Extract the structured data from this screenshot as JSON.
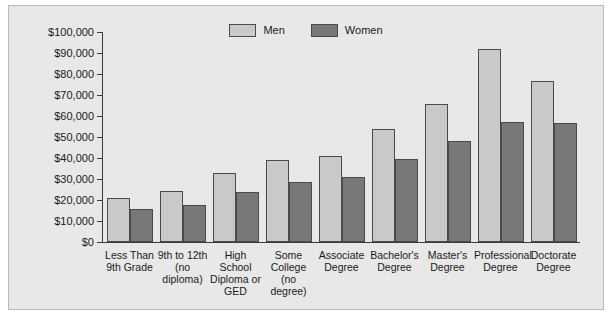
{
  "chart_data": {
    "type": "bar",
    "title": "",
    "xlabel": "",
    "ylabel": "",
    "grid": false,
    "legend_position": "top-center",
    "ylim": [
      0,
      100000
    ],
    "ytick_labels": [
      "$100,000",
      "$90,000",
      "$80,000",
      "$70,000",
      "$60,000",
      "$50,000",
      "$40,000",
      "$30,000",
      "$20,000",
      "$10,000",
      "$0"
    ],
    "ytick_values": [
      100000,
      90000,
      80000,
      70000,
      60000,
      50000,
      40000,
      30000,
      20000,
      10000,
      0
    ],
    "categories": [
      "Less Than\n9th Grade",
      "9th to 12th\n(no diploma)",
      "High School\nDiploma or\nGED",
      "Some\nCollege\n(no degree)",
      "Associate\nDegree",
      "Bachelor's\nDegree",
      "Master's\nDegree",
      "Professional\nDegree",
      "Doctorate\nDegree"
    ],
    "category_lines": [
      [
        "Less Than",
        "9th Grade"
      ],
      [
        "9th to 12th",
        "(no diploma)"
      ],
      [
        "High School",
        "Diploma or",
        "GED"
      ],
      [
        "Some",
        "College",
        "(no degree)"
      ],
      [
        "Associate",
        "Degree"
      ],
      [
        "Bachelor's",
        "Degree"
      ],
      [
        "Master's",
        "Degree"
      ],
      [
        "Professional",
        "Degree"
      ],
      [
        "Doctorate",
        "Degree"
      ]
    ],
    "series": [
      {
        "name": "Men",
        "color": "#c9c9c9",
        "values": [
          21000,
          24500,
          33000,
          39000,
          41000,
          54000,
          65500,
          92000,
          76500
        ]
      },
      {
        "name": "Women",
        "color": "#787878",
        "values": [
          15500,
          17500,
          24000,
          28500,
          31000,
          39500,
          48000,
          57000,
          56500
        ]
      }
    ]
  },
  "legend": {
    "items": [
      {
        "label": "Men",
        "color": "#c9c9c9"
      },
      {
        "label": "Women",
        "color": "#787878"
      }
    ]
  },
  "colors": {
    "panel_background": "#e8e8e8",
    "panel_border": "#b9b9b9",
    "axis": "#3a3a3a",
    "bar_border": "#4a4a4a",
    "text": "#1a1a1a",
    "men": "#c9c9c9",
    "women": "#787878"
  }
}
